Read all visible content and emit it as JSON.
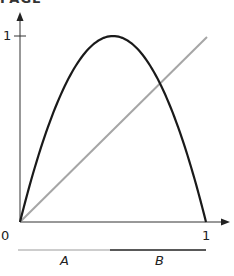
{
  "header": {
    "cropped_title": "PAGE"
  },
  "axes": {
    "x_tick_zero": "0",
    "x_tick_one": "1",
    "y_tick_one": "1"
  },
  "segments": {
    "a_label": "A",
    "b_label": "B",
    "a_color": "#bdbdbd",
    "b_color": "#222222"
  },
  "curves": {
    "parabola_color": "#1a1a1a",
    "diagonal_color": "#a6a6a6"
  },
  "chart_data": {
    "type": "line",
    "title": "",
    "xlabel": "",
    "ylabel": "",
    "xlim": [
      0,
      1
    ],
    "ylim": [
      0,
      1
    ],
    "grid": false,
    "x_ticks": [
      "0",
      "1"
    ],
    "y_ticks": [
      "1"
    ],
    "series": [
      {
        "name": "f(x) = 4x(1-x)",
        "x": [
          0,
          0.1,
          0.2,
          0.3,
          0.4,
          0.5,
          0.6,
          0.7,
          0.75,
          0.8,
          0.9,
          1.0
        ],
        "values": [
          0,
          0.36,
          0.64,
          0.84,
          0.96,
          1.0,
          0.96,
          0.84,
          0.75,
          0.64,
          0.36,
          0
        ]
      },
      {
        "name": "y = x",
        "x": [
          0,
          1
        ],
        "values": [
          0,
          1
        ]
      }
    ],
    "annotations": [
      {
        "text": "A",
        "interval": [
          0,
          0.5
        ]
      },
      {
        "text": "B",
        "interval": [
          0.5,
          1
        ]
      }
    ]
  }
}
